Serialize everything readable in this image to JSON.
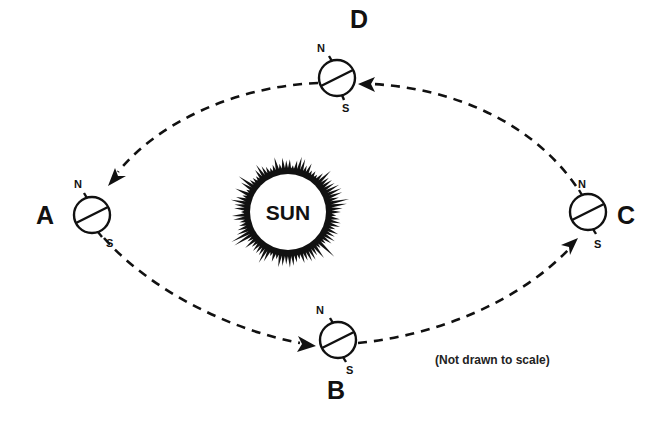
{
  "diagram": {
    "sun": {
      "label": "SUN"
    },
    "positions": [
      {
        "id": "A",
        "label": "A",
        "north": "N",
        "south": "S"
      },
      {
        "id": "B",
        "label": "B",
        "north": "N",
        "south": "S"
      },
      {
        "id": "C",
        "label": "C",
        "north": "N",
        "south": "S"
      },
      {
        "id": "D",
        "label": "D",
        "north": "N",
        "south": "S"
      }
    ],
    "orbit_direction": "A → B → C → D → A (counterclockwise as drawn)",
    "note": "(Not drawn to scale)"
  },
  "colors": {
    "ink": "#111111",
    "background": "#ffffff"
  }
}
